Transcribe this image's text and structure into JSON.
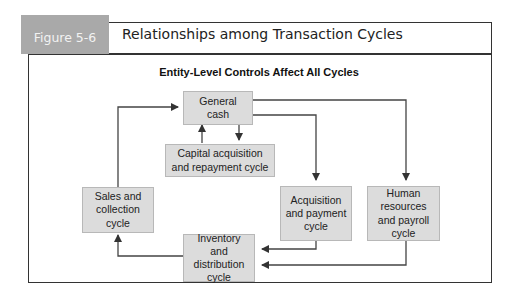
{
  "figure": {
    "label": "Figure 5-6",
    "title": "Relationships among Transaction Cycles",
    "subtitle": "Entity-Level Controls Affect All Cycles"
  },
  "nodes": [
    {
      "id": "general-cash",
      "label": "General cash"
    },
    {
      "id": "capital",
      "label": "Capital acquisition and repayment cycle"
    },
    {
      "id": "sales",
      "label": "Sales and collection cycle"
    },
    {
      "id": "acquisition",
      "label": "Acquisition and payment cycle"
    },
    {
      "id": "human",
      "label": "Human resources and payroll cycle"
    },
    {
      "id": "inventory",
      "label": "Inventory and distribution cycle"
    }
  ],
  "edges": [
    {
      "from": "sales",
      "to": "general-cash"
    },
    {
      "from": "capital",
      "to": "general-cash"
    },
    {
      "from": "general-cash",
      "to": "capital"
    },
    {
      "from": "general-cash",
      "to": "acquisition"
    },
    {
      "from": "general-cash",
      "to": "human"
    },
    {
      "from": "acquisition",
      "to": "inventory"
    },
    {
      "from": "human",
      "to": "inventory"
    },
    {
      "from": "inventory",
      "to": "sales"
    }
  ],
  "colors": {
    "label_bg": "#a9a9a9",
    "box_bg": "#dcdcdc",
    "line": "#333333"
  }
}
